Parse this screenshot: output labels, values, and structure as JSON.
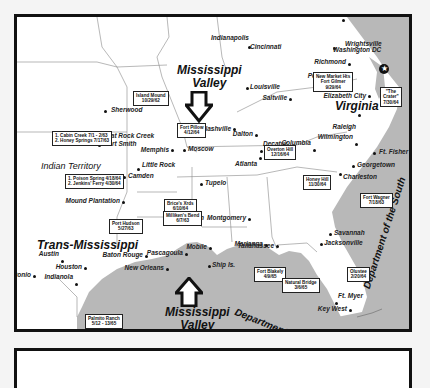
{
  "map": {
    "regions": {
      "mississippi_valley_north": "Mississippi\nValley",
      "mississippi_valley_south": "Mississippi\nValley",
      "virginia": "Virginia",
      "trans_mississippi": "Trans-Mississippi",
      "indian_territory": "Indian Territory",
      "dept_gulf": "Department of the Gulf",
      "dept_south": "Department of the South"
    },
    "cities": [
      "Wrightsville",
      "Indianapolis",
      "Cincinnati",
      "Washington DC",
      "Richmond",
      "Petersburg",
      "Louisville",
      "Saltville",
      "Elizabeth City",
      "Raleigh",
      "Sherwood",
      "Nashville",
      "Flat Rock Creek",
      "Fort Smith",
      "Memphis",
      "Moscow",
      "Wilmington",
      "Ft. Fisher",
      "Little Rock",
      "Camden",
      "Tupelo",
      "Dalton",
      "Decatur",
      "Atlanta",
      "Columbia",
      "Georgetown",
      "Charleston",
      "Mound Plantation",
      "Jackson",
      "Montgomery",
      "Savannah",
      "Austin",
      "Baton Rouge",
      "Pascagoula",
      "Mobile",
      "Marianna",
      "Tallahassee",
      "Jacksonville",
      "Houston",
      "San Antonio",
      "Indianola",
      "New Orleans",
      "Ship Is.",
      "Ft. Myer",
      "Key West",
      "Brownsville"
    ],
    "battles": {
      "island_mound": [
        "Island Mound",
        "10/29/62"
      ],
      "new_market_fort_gilmer": [
        "New Market Hts",
        "Fort Gilmer",
        "9/29/64"
      ],
      "the_crater": [
        "\"The",
        "Crater\"",
        "7/30/64"
      ],
      "cabin_creek": [
        "1. Cabin Creek 7/1 - 2/63",
        "2. Honey Springs 7/17/63"
      ],
      "fort_pillow": [
        "Fort Pillow",
        "4/12/64"
      ],
      "overton_hill": [
        "Overton Hill",
        "12/16/64"
      ],
      "poison_spring": [
        "1. Poison Spring 4/18/64",
        "2. Jenkins' Ferry 4/30/64"
      ],
      "honey_hill": [
        "Honey Hill",
        "11/30/64"
      ],
      "brices_xrds": [
        "Brice's Xrds",
        "6/10/64"
      ],
      "millikens_bend": [
        "Milliken's Bend",
        "6/7/63"
      ],
      "fort_wagner": [
        "Fort Wagner",
        "7/18/63"
      ],
      "port_hudson": [
        "Port Hudson",
        "5/27/63"
      ],
      "fort_blakely": [
        "Fort Blakely",
        "4/9/65"
      ],
      "natural_bridge": [
        "Natural Bridge",
        "3/6/65"
      ],
      "olustee": [
        "Olustee",
        "2/20/64"
      ],
      "palmito_ranch": [
        "Palmito Ranch",
        "5/12 - 13/65"
      ]
    },
    "colors": {
      "water": "#b8b8b8",
      "land": "#ffffff",
      "border": "#111111"
    }
  }
}
